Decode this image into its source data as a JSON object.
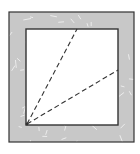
{
  "diagram": {
    "type": "geometric-figure",
    "colors": {
      "background": "#ffffff",
      "frame_fill": "#c8c8c8",
      "frame_speck": "#ececec",
      "outline": "#333333",
      "dashed_line": "#333333",
      "inner_fill": "#ffffff"
    },
    "outer_square": {
      "x": 9,
      "y": 12,
      "width": 125,
      "height": 130
    },
    "inner_square": {
      "x": 26,
      "y": 29,
      "width": 92,
      "height": 96
    },
    "origin_point": {
      "x": 27,
      "y": 124
    },
    "rays": [
      {
        "name": "ray-to-top-edge",
        "x2": 77,
        "y2": 29
      },
      {
        "name": "ray-to-right-edge",
        "x2": 118,
        "y2": 70
      }
    ]
  }
}
